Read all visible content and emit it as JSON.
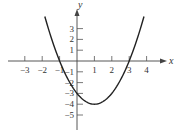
{
  "chart_data": {
    "type": "line",
    "title": "",
    "xlabel": "x",
    "ylabel": "y",
    "xlim": [
      -3.6,
      4.7
    ],
    "ylim": [
      -6.5,
      5.5
    ],
    "x_ticks": [
      -3,
      -2,
      -1,
      1,
      2,
      3,
      4
    ],
    "x_tick_labels": [
      "−3",
      "−2",
      "−1",
      "1",
      "2",
      "3",
      "4"
    ],
    "y_ticks": [
      -5,
      -4,
      -3,
      -2,
      -1,
      1,
      2,
      3
    ],
    "y_tick_labels": [
      "−5",
      "−4",
      "−3",
      "−2",
      "−1",
      "1",
      "2",
      "3"
    ],
    "grid": false,
    "series": [
      {
        "name": "y = x² − 2x − 3",
        "equation": "x^2 - 2x - 3",
        "domain": [
          -1.85,
          3.85
        ],
        "key_points": {
          "x_intercepts": [
            -1,
            3
          ],
          "y_intercept": -3,
          "vertex": [
            1,
            -4
          ]
        },
        "color": "#222222"
      }
    ]
  }
}
